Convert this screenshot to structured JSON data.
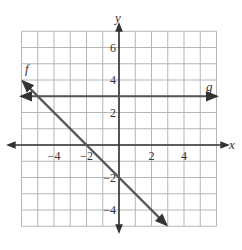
{
  "chart_data": {
    "type": "line",
    "title": "",
    "xlabel": "x",
    "ylabel": "y",
    "xlim": [
      -6,
      6
    ],
    "ylim": [
      -5,
      7
    ],
    "grid": true,
    "grid_step": 1,
    "x_ticks": [
      -4,
      -2,
      2,
      4
    ],
    "y_ticks": [
      6,
      4,
      2,
      -2,
      -4
    ],
    "x_tick_labels": [
      "−4",
      "−2",
      "2",
      "4"
    ],
    "y_tick_labels": [
      "6",
      "4",
      "2",
      "−2",
      "−4"
    ],
    "series": [
      {
        "name": "f",
        "equation": "y = -x - 2",
        "points": [
          [
            -5.9,
            3.9
          ],
          [
            2.9,
            -4.9
          ]
        ],
        "color": "#555555"
      },
      {
        "name": "g",
        "equation": "y = 3",
        "points": [
          [
            -6,
            3
          ],
          [
            6,
            3
          ]
        ],
        "color": "#555555"
      }
    ],
    "legend": "inline labels: f at upper-left end, g at right end"
  },
  "labels": {
    "x_axis": "x",
    "y_axis": "y",
    "f": "f",
    "g": "g"
  }
}
